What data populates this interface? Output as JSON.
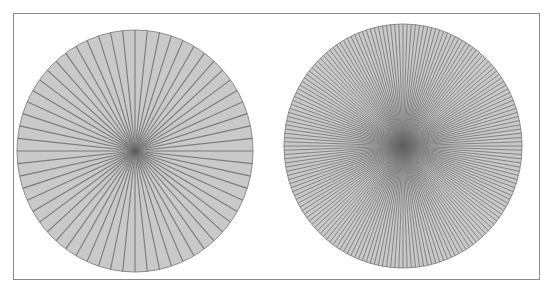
{
  "caption": {
    "visible_fragment": ""
  },
  "figure": {
    "frame": {
      "x": 13,
      "y": 13,
      "width": 527,
      "height": 267,
      "border_color": "#8a8a8a"
    },
    "colors": {
      "disk_fill": "#c9c9c9",
      "disk_outline": "#8c8c8c",
      "spoke": "#7a7a7a",
      "center_dark": "#5a5a5a"
    },
    "panels": [
      {
        "name": "left-spoke-disk",
        "cx": 135,
        "cy": 151,
        "rx": 118,
        "ry": 121,
        "spoke_count": 60,
        "spoke_width": 1.1,
        "center_radius": 9
      },
      {
        "name": "right-spoke-disk",
        "cx": 403,
        "cy": 146,
        "rx": 119,
        "ry": 122,
        "spoke_count": 180,
        "spoke_width": 0.9,
        "center_radius": 22
      }
    ]
  }
}
